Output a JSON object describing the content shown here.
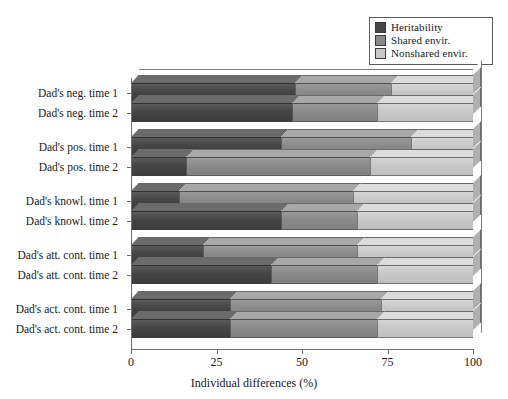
{
  "chart_data": {
    "type": "bar",
    "orientation": "horizontal",
    "stacked": true,
    "title": "",
    "xlabel": "Individual differences (%)",
    "ylabel": "",
    "xlim": [
      0,
      100
    ],
    "xticks": [
      "0",
      "25",
      "50",
      "75",
      "100"
    ],
    "grid": false,
    "legend_position": "top-right",
    "categories": [
      "Dad's neg. time 1",
      "Dad's neg. time 2",
      "Dad's pos. time 1",
      "Dad's pos. time 2",
      "Dad's knowl. time 1",
      "Dad's knowl. time 2",
      "Dad's att. cont. time 1",
      "Dad's att. cont. time 2",
      "Dad's act. cont. time 1",
      "Dad's act. cont. time 2"
    ],
    "series": [
      {
        "name": "Heritability",
        "color": "#454545",
        "values": [
          48,
          47,
          44,
          16,
          14,
          44,
          21,
          41,
          29,
          29
        ]
      },
      {
        "name": "Shared envir.",
        "color": "#8a8a8a",
        "values": [
          28,
          25,
          38,
          54,
          51,
          22,
          45,
          31,
          44,
          43
        ]
      },
      {
        "name": "Nonshared envir.",
        "color": "#c8c8c8",
        "values": [
          24,
          28,
          18,
          30,
          35,
          34,
          34,
          28,
          27,
          28
        ]
      }
    ]
  },
  "legend": {
    "items": [
      {
        "label": "Heritability",
        "color": "#454545"
      },
      {
        "label": "Shared envir.",
        "color": "#8a8a8a"
      },
      {
        "label": "Nonshared envir.",
        "color": "#c8c8c8"
      }
    ]
  },
  "axis": {
    "x_title": "Individual differences (%)",
    "x_ticks": [
      "0",
      "25",
      "50",
      "75",
      "100"
    ]
  }
}
